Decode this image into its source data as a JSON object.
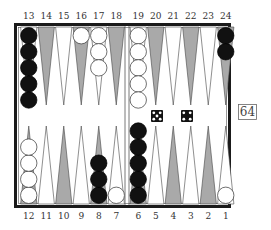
{
  "board": {
    "top_labels": [
      "13",
      "14",
      "15",
      "16",
      "17",
      "18",
      "19",
      "20",
      "21",
      "22",
      "23",
      "24"
    ],
    "bottom_labels": [
      "12",
      "11",
      "10",
      "9",
      "8",
      "7",
      "6",
      "5",
      "4",
      "3",
      "2",
      "1"
    ],
    "colors": {
      "frame": "#1a1a1a",
      "shaded_point": "#a9a9a9",
      "light_point": "#ffffff",
      "black_checker": "#111111",
      "white_checker": "#ffffff"
    },
    "points": [
      {
        "point": 13,
        "color": "black",
        "count": 5
      },
      {
        "point": 14,
        "color": null,
        "count": 0
      },
      {
        "point": 15,
        "color": null,
        "count": 0
      },
      {
        "point": 16,
        "color": "white",
        "count": 1
      },
      {
        "point": 17,
        "color": "white",
        "count": 3
      },
      {
        "point": 18,
        "color": null,
        "count": 0
      },
      {
        "point": 19,
        "color": "white",
        "count": 5
      },
      {
        "point": 20,
        "color": null,
        "count": 0
      },
      {
        "point": 21,
        "color": null,
        "count": 0
      },
      {
        "point": 22,
        "color": null,
        "count": 0
      },
      {
        "point": 23,
        "color": null,
        "count": 0
      },
      {
        "point": 24,
        "color": "black",
        "count": 2
      },
      {
        "point": 12,
        "color": "white",
        "count": 4
      },
      {
        "point": 11,
        "color": null,
        "count": 0
      },
      {
        "point": 10,
        "color": null,
        "count": 0
      },
      {
        "point": 9,
        "color": null,
        "count": 0
      },
      {
        "point": 8,
        "color": "black",
        "count": 3
      },
      {
        "point": 7,
        "color": "white",
        "count": 1
      },
      {
        "point": 6,
        "color": "black",
        "count": 5
      },
      {
        "point": 5,
        "color": null,
        "count": 0
      },
      {
        "point": 4,
        "color": null,
        "count": 0
      },
      {
        "point": 3,
        "color": null,
        "count": 0
      },
      {
        "point": 2,
        "color": null,
        "count": 0
      },
      {
        "point": 1,
        "color": "white",
        "count": 1
      }
    ]
  },
  "dice": [
    5,
    4
  ],
  "cube": {
    "value": "64"
  }
}
